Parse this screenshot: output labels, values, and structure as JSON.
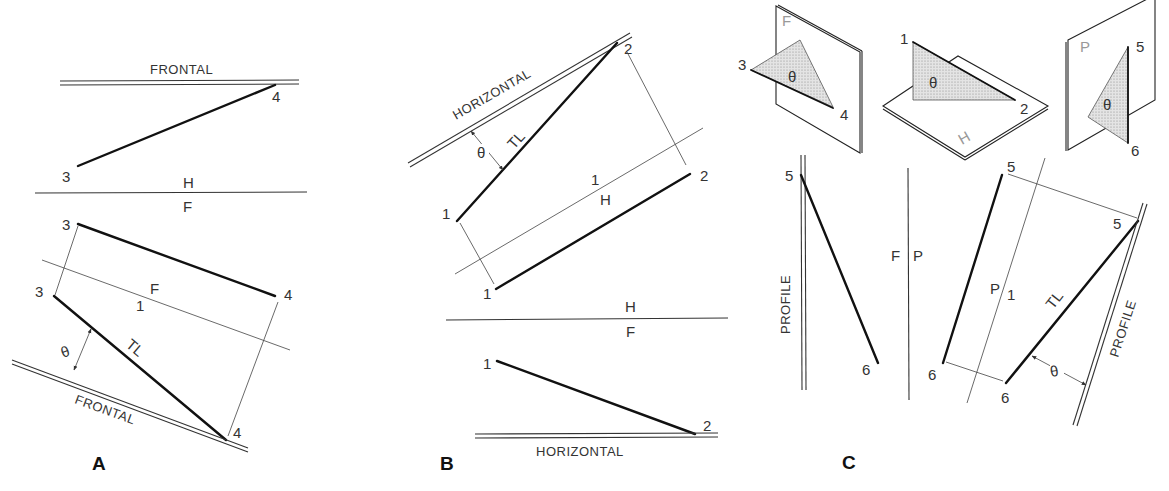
{
  "figure": {
    "panels": [
      {
        "id": "A",
        "label": "A",
        "top_plane_label": "FRONTAL",
        "fold_line_HF": {
          "upper": "H",
          "lower": "F"
        },
        "fold_line_F1": {
          "upper": "F",
          "lower": "1"
        },
        "auxiliary_plane_label": "FRONTAL",
        "true_length_label": "TL",
        "angle_label": "θ",
        "points": {
          "p3_top": "3",
          "p4_top": "4",
          "p3_front": "3",
          "p4_front": "4",
          "p3_aux": "3",
          "p4_aux": "4"
        }
      },
      {
        "id": "B",
        "label": "B",
        "auxiliary_plane_label": "HORIZONTAL",
        "fold_line_H1": {
          "upper": "1",
          "lower": "H"
        },
        "fold_line_HF": {
          "upper": "H",
          "lower": "F"
        },
        "bottom_plane_label": "HORIZONTAL",
        "true_length_label": "TL",
        "angle_label": "θ",
        "points": {
          "p1_aux": "1",
          "p2_aux": "2",
          "p1_top": "1",
          "p2_top": "2",
          "p1_front": "1",
          "p2_front": "2"
        }
      },
      {
        "id": "C",
        "label": "C",
        "left_plane_label": "PROFILE",
        "fold_line_FP": {
          "left": "F",
          "right": "P"
        },
        "fold_line_P1": {
          "left": "P",
          "right": "1"
        },
        "auxiliary_plane_label": "PROFILE",
        "true_length_label": "TL",
        "angle_label": "θ",
        "points": {
          "p5_front": "5",
          "p6_front": "6",
          "p5_side": "5",
          "p6_side": "6",
          "p5_aux": "5",
          "p6_aux": "6"
        }
      }
    ],
    "pictorials": [
      {
        "plane": "F",
        "angle": "θ",
        "points": [
          "3",
          "4"
        ]
      },
      {
        "plane": "H",
        "angle": "θ",
        "points": [
          "1",
          "2"
        ]
      },
      {
        "plane": "P",
        "angle": "θ",
        "points": [
          "5",
          "6"
        ]
      }
    ]
  }
}
